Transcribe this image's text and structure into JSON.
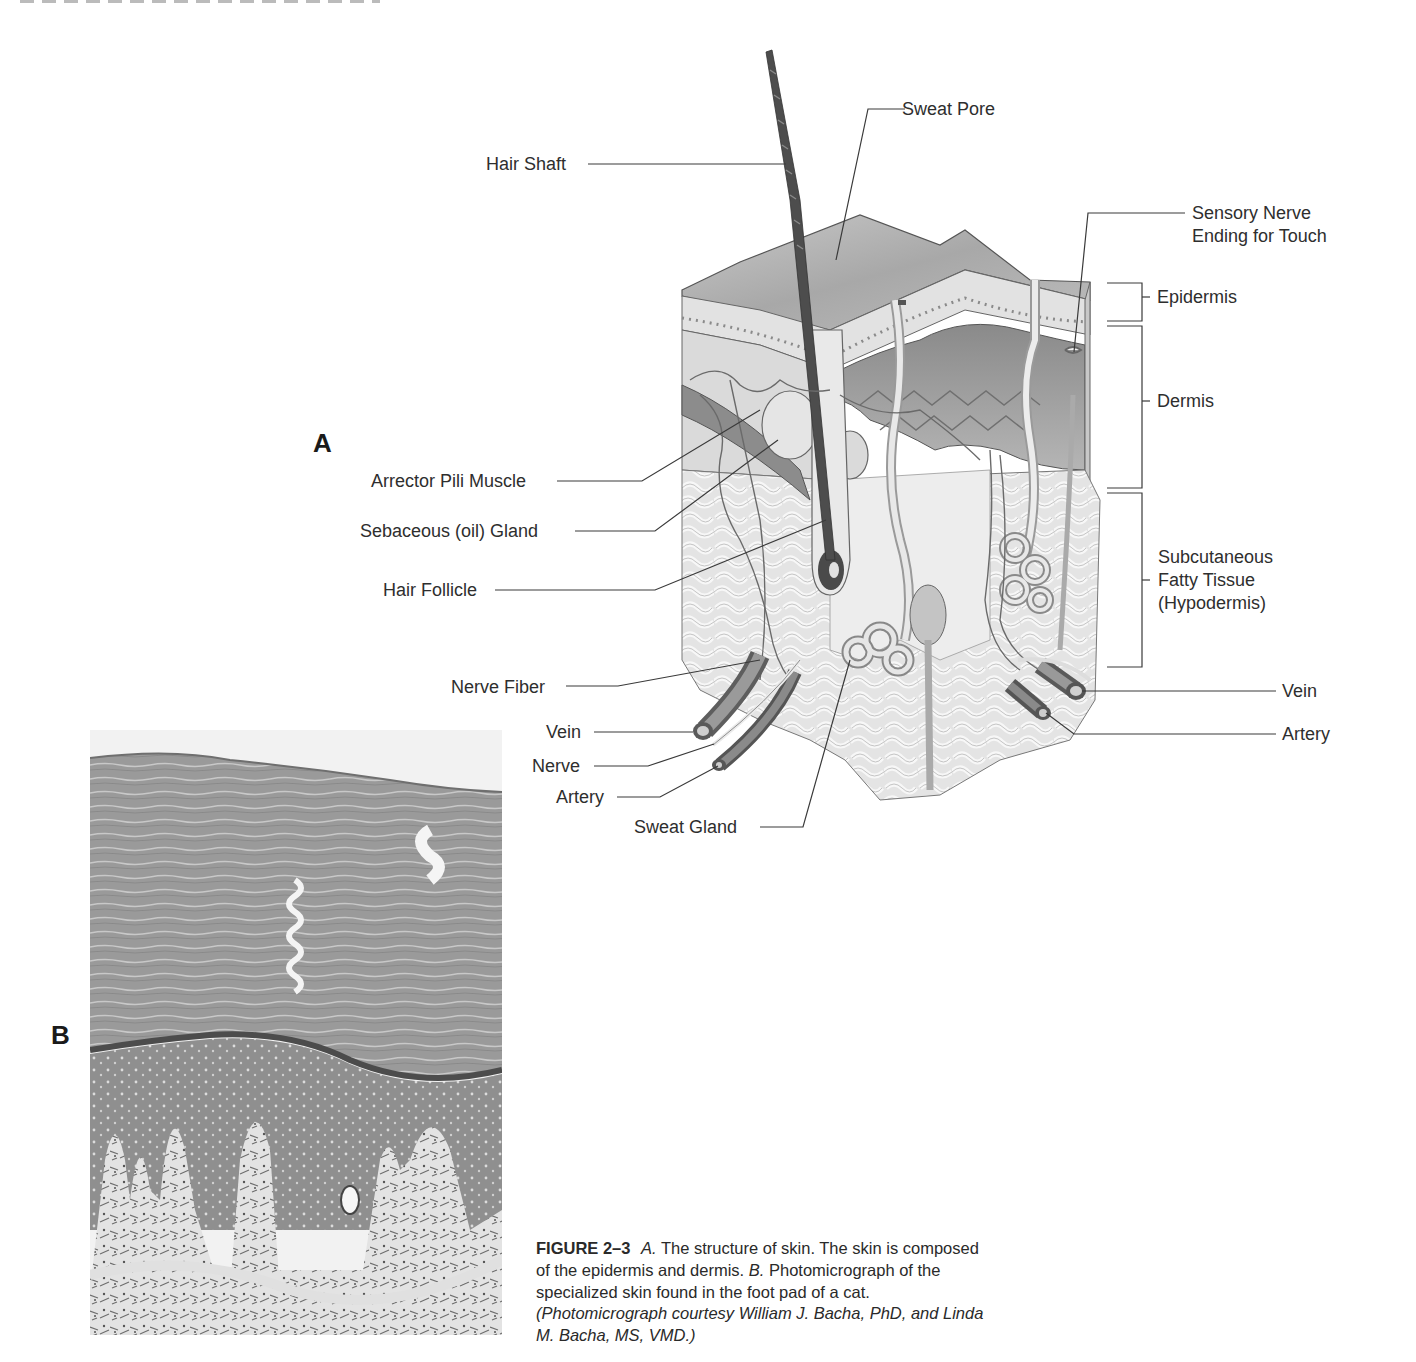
{
  "page": {
    "header_fragment": "(cropped running header at top edge)"
  },
  "figure": {
    "number": "FIGURE 2–3",
    "panels": {
      "a": "A",
      "b": "B"
    },
    "labels_left": {
      "hair_shaft": "Hair Shaft",
      "arrector_pili": "Arrector Pili Muscle",
      "sebaceous_gland": "Sebaceous (oil) Gland",
      "hair_follicle": "Hair Follicle",
      "nerve_fiber": "Nerve Fiber",
      "vein": "Vein",
      "nerve": "Nerve",
      "artery": "Artery",
      "sweat_gland": "Sweat Gland"
    },
    "labels_right": {
      "sweat_pore": "Sweat Pore",
      "sensory_nerve_line1": "Sensory Nerve",
      "sensory_nerve_line2": "Ending for Touch",
      "epidermis": "Epidermis",
      "dermis": "Dermis",
      "subcutaneous_line1": "Subcutaneous",
      "subcutaneous_line2": "Fatty Tissue",
      "subcutaneous_line3": "(Hypodermis)",
      "vein": "Vein",
      "artery": "Artery"
    },
    "caption": {
      "part_a_label": "A.",
      "part_a_text": " The structure of skin. The skin is composed of the epidermis and dermis. ",
      "part_b_label": "B.",
      "part_b_text": " Photomicrograph of the specialized skin found in the foot pad of a cat. ",
      "credit": "(Photomicrograph courtesy William J. Bacha, PhD, and Linda M. Bacha, MS, VMD.)"
    }
  },
  "colors": {
    "ink": "#2e2e2e",
    "diagram_dark": "#5a5a5a",
    "diagram_mid": "#9a9a9a",
    "diagram_light": "#d9d9d9",
    "fat_tissue": "#e6e6e6",
    "histology_dark": "#7d7d7d",
    "histology_light": "#e8e8e8"
  }
}
